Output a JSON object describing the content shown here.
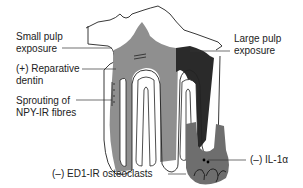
{
  "diagram": {
    "labels": {
      "small_pulp": {
        "line1": "Small pulp",
        "line2": "exposure"
      },
      "reparative": {
        "line1": "(+) Reparative",
        "line2": "dentin"
      },
      "sprouting": {
        "line1": "Sprouting of",
        "line2": "NPY-IR fibres"
      },
      "large_pulp": {
        "line1": "Large pulp",
        "line2": "exposure"
      },
      "il1": {
        "line1": "(–) IL-1α"
      },
      "ed1": {
        "line1": "(–) ED1-IR osteoclasts"
      }
    },
    "colors": {
      "pulp_light": "#8f8f8f",
      "pulp_dark": "#2a2a2a",
      "lesion": "#6e6e6e",
      "outline": "#222222",
      "text": "#222222"
    }
  }
}
